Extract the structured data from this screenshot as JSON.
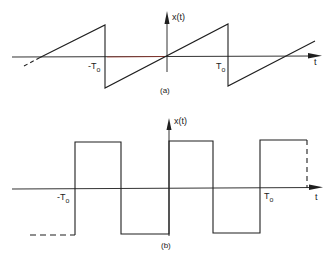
{
  "figure_a": {
    "y_axis_label": "x(t)",
    "x_axis_label": "t",
    "tick_neg_period_prefix": "-T",
    "tick_pos_period_prefix": "T",
    "period_subscript": "o",
    "caption": "(a)",
    "waveform": "sawtooth"
  },
  "figure_b": {
    "y_axis_label": "x(t)",
    "x_axis_label": "t",
    "tick_neg_period_prefix": "-T",
    "tick_pos_period_prefix": "T",
    "period_subscript": "o",
    "caption": "(b)",
    "waveform": "square"
  },
  "colors": {
    "line": "#1f1f1f",
    "axis_highlight": "#c0392b"
  }
}
